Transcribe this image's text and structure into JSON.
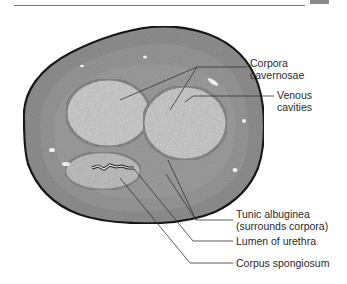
{
  "figure": {
    "labels": [
      {
        "id": "corpora-cavernosae",
        "lines": [
          "Corpora",
          "cavernosae"
        ]
      },
      {
        "id": "venous-cavities",
        "lines": [
          "Venous",
          "cavities"
        ]
      },
      {
        "id": "tunic-albuginea",
        "lines": [
          "Tunic albuginea",
          "(surrounds corpora)"
        ]
      },
      {
        "id": "lumen-of-urethra",
        "lines": [
          "Lumen of urethra"
        ]
      },
      {
        "id": "corpus-spongiosum",
        "lines": [
          "Corpus spongiosum"
        ]
      }
    ]
  },
  "colors": {
    "tissue_base": "#8e8e8e",
    "tissue_edge": "#1e1e1e",
    "spongy_tissue": "#c9c9c9",
    "leader_line": "#333333",
    "label_text": "#2a2a2a"
  }
}
